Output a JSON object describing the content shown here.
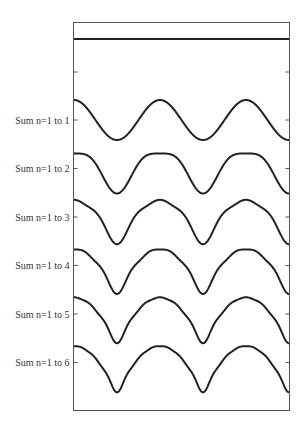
{
  "chart_data": {
    "type": "line",
    "title": "",
    "xlabel": "",
    "ylabel": "",
    "x_range": [
      0,
      15.708
    ],
    "grid": false,
    "legend": "none",
    "constant_line": {
      "label": "",
      "value": 1.645
    },
    "series": [
      {
        "name": "Sum n=1 to 1",
        "terms": 1
      },
      {
        "name": "Sum n=1 to 2",
        "terms": 2
      },
      {
        "name": "Sum n=1 to 3",
        "terms": 3
      },
      {
        "name": "Sum n=1 to 4",
        "terms": 4
      },
      {
        "name": "Sum n=1 to 5",
        "terms": 5
      },
      {
        "name": "Sum n=1 to 6",
        "terms": 6
      }
    ],
    "tick_labels": [
      "Sum n=1 to 1",
      "Sum n=1 to 2",
      "Sum n=1 to 3",
      "Sum n=1 to 4",
      "Sum n=1 to 5",
      "Sum n=1 to 6"
    ]
  },
  "layout": {
    "box": {
      "left": 73.5,
      "top": 22.5,
      "right": 289.5,
      "bottom": 410.5
    },
    "zero_line_y": 72,
    "first_series_y": 120,
    "series_spacing": 48.5,
    "px_per_unit": 20,
    "line_color": "#222222",
    "frame_color": "#555555"
  }
}
